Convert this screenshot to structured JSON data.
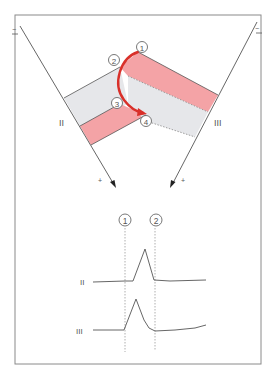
{
  "figure": {
    "colors": {
      "frame": "#8a8a8a",
      "line": "#555555",
      "pink": "#f4a3a6",
      "gray_band": "#e6e7ea",
      "arrow": "#d9302a",
      "dotted": "#9a9a9a"
    },
    "leads": {
      "left": {
        "label": "II",
        "neg_sign": "−",
        "pos_sign": "+"
      },
      "right": {
        "label": "III",
        "neg_sign": "−",
        "pos_sign": "+"
      }
    },
    "markers": {
      "m1": "1",
      "m2": "2",
      "m3": "3",
      "m4": "4"
    },
    "ecg": {
      "time_markers": [
        "1",
        "2"
      ],
      "traces": [
        {
          "label": "II"
        },
        {
          "label": "III"
        }
      ]
    }
  }
}
